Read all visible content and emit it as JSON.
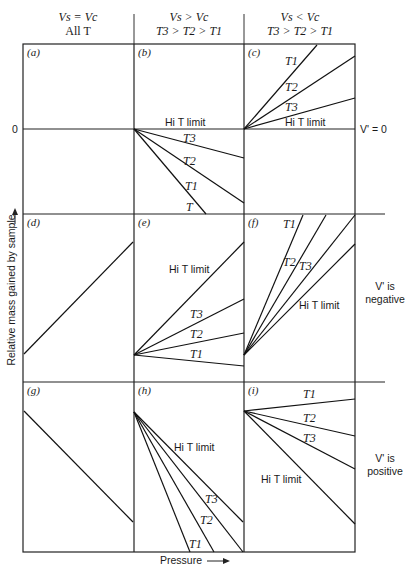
{
  "figure": {
    "headers": [
      {
        "line1": "Vs = Vc",
        "line2": "All T"
      },
      {
        "line1": "Vs > Vc",
        "line2": "T3 > T2 > T1"
      },
      {
        "line1": "Vs < Vc",
        "line2": "T3 > T2 > T1"
      }
    ],
    "axes": {
      "ylabel": "Relative mass gained by sample",
      "xlabel": "Pressure",
      "zero_label": "0"
    },
    "row_notes": [
      {
        "text1": "V' = 0",
        "text2": ""
      },
      {
        "text1": "V' is",
        "text2": "negative"
      },
      {
        "text1": "V' is",
        "text2": "positive"
      }
    ],
    "panels": [
      {
        "tag": "(a)",
        "lines": [],
        "labels": []
      },
      {
        "tag": "(b)",
        "labels": [
          "Hi T limit",
          "T3",
          "T2",
          "T1",
          "T"
        ]
      },
      {
        "tag": "(c)",
        "labels": [
          "T1",
          "T2",
          "T3",
          "Hi T limit"
        ]
      },
      {
        "tag": "(d)",
        "labels": []
      },
      {
        "tag": "(e)",
        "labels": [
          "Hi T limit",
          "T3",
          "T2",
          "T1"
        ]
      },
      {
        "tag": "(f)",
        "labels": [
          "T1",
          "T2",
          "T3",
          "Hi T limit"
        ]
      },
      {
        "tag": "(g)",
        "labels": []
      },
      {
        "tag": "(h)",
        "labels": [
          "Hi T limit",
          "T3",
          "T2",
          "T1"
        ]
      },
      {
        "tag": "(i)",
        "labels": [
          "T1",
          "T2",
          "T3",
          "Hi T limit"
        ]
      }
    ]
  }
}
